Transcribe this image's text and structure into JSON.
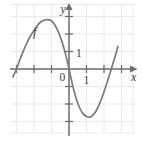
{
  "figure": {
    "width": 143,
    "height": 146,
    "background_color": "#ffffff",
    "grid_color": "#e4e4e6",
    "axis_color": "#6e6e72",
    "curve_color": "#7a7a80",
    "text_color": "#3b3b3f"
  },
  "labels": {
    "y_axis": "y",
    "x_axis": "x",
    "origin": "0",
    "y_unit": "1",
    "x_unit": "1",
    "curve": "f"
  },
  "chart_data": {
    "type": "line",
    "xlabel": "x",
    "ylabel": "y",
    "grid": true,
    "legend": null,
    "annotations": [
      {
        "text": "f",
        "x": -2.5,
        "y": 2.3,
        "note": "curve label on rising left branch"
      },
      {
        "text": "0",
        "x": -0.25,
        "y": -0.35,
        "note": "origin label"
      },
      {
        "text": "1",
        "x": 0.3,
        "y": 1.0,
        "note": "y-axis unit tick label"
      },
      {
        "text": "1",
        "x": 1.0,
        "y": -0.45,
        "note": "x-axis unit tick label"
      }
    ],
    "xlim": [
      -3.8,
      4.2
    ],
    "ylim": [
      -3.7,
      4.4
    ],
    "xticks": [
      -3,
      -2,
      -1,
      0,
      1,
      2,
      3
    ],
    "yticks": [
      -3,
      -2,
      -1,
      0,
      1,
      2,
      3
    ],
    "x_unit_px": 17.5,
    "y_unit_px": 17.5,
    "origin_px": {
      "x": 69,
      "y": 69
    },
    "series": [
      {
        "name": "f",
        "x": [
          -3.2,
          -3.0,
          -2.8,
          -2.6,
          -2.4,
          -2.2,
          -2.0,
          -1.8,
          -1.6,
          -1.4,
          -1.2,
          -1.0,
          -0.8,
          -0.6,
          -0.4,
          -0.2,
          0.0,
          0.2,
          0.4,
          0.6,
          0.8,
          1.0,
          1.2,
          1.4,
          1.6,
          1.8,
          2.0,
          2.2,
          2.4,
          2.6,
          2.8
        ],
        "y": [
          -0.45,
          0.0,
          0.55,
          1.05,
          1.5,
          1.9,
          2.2,
          2.5,
          2.7,
          2.8,
          2.82,
          2.75,
          2.5,
          2.1,
          1.55,
          0.85,
          0.0,
          -0.9,
          -1.65,
          -2.2,
          -2.55,
          -2.72,
          -2.75,
          -2.6,
          -2.3,
          -1.85,
          -1.3,
          -0.7,
          -0.05,
          0.6,
          1.3
        ]
      }
    ],
    "roots": [
      -3.0,
      0.0,
      2.42
    ],
    "local_max": {
      "x": -1.25,
      "y": 2.83
    },
    "local_min": {
      "x": 1.15,
      "y": -2.76
    }
  }
}
